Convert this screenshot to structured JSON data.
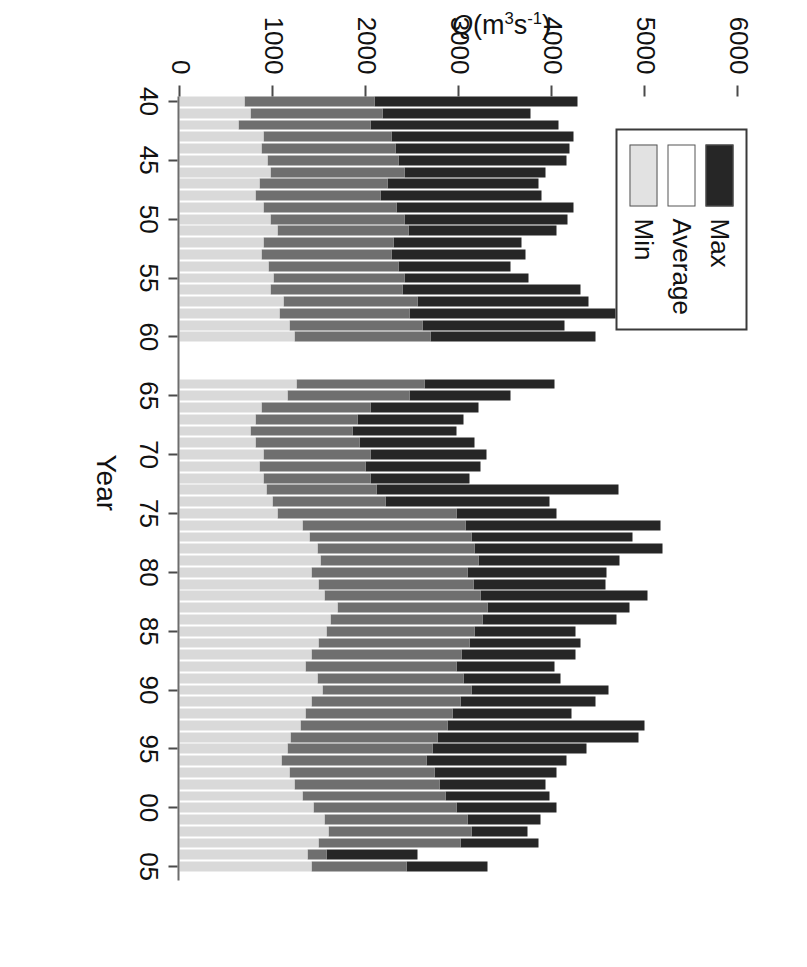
{
  "chart_data": {
    "type": "bar",
    "subtype": "stacked-horizontal-rotated",
    "title": "",
    "xlabel": "Year",
    "ylabel": "Q(m3s-1)",
    "ylabel_rich": "Q(m³s⁻¹)",
    "ylim": [
      0,
      6500
    ],
    "yticks": [
      0,
      1000,
      2000,
      3000,
      4000,
      5000,
      6000
    ],
    "ytick_labels": [
      "0",
      "1000",
      "2000",
      "3000",
      "4000",
      "5000",
      "6000"
    ],
    "xticks": [
      40,
      45,
      50,
      55,
      60,
      65,
      70,
      75,
      80,
      85,
      90,
      95,
      100,
      105
    ],
    "xtick_labels": [
      "40",
      "45",
      "50",
      "55",
      "60",
      "65",
      "70",
      "75",
      "80",
      "85",
      "90",
      "95",
      "00",
      "05"
    ],
    "grid": false,
    "legend_position": "upper-left",
    "orientation": "rotated-90-cw",
    "colors": {
      "max": "#262626",
      "average": "#6f6f6f",
      "min": "#d9d9d9",
      "axis": "#4a4a4a",
      "background": "#ffffff"
    },
    "series": [
      {
        "name": "Min",
        "key": "min"
      },
      {
        "name": "Average",
        "key": "average"
      },
      {
        "name": "Max",
        "key": "max"
      }
    ],
    "note": "Each year is one stacked bar: Min segment from 0, then Average, then Max (cumulative stacked, total = Max).",
    "categories": [
      1940,
      1941,
      1942,
      1943,
      1944,
      1945,
      1946,
      1947,
      1948,
      1949,
      1950,
      1951,
      1952,
      1953,
      1954,
      1955,
      1956,
      1957,
      1958,
      1959,
      1960,
      1964,
      1965,
      1966,
      1967,
      1968,
      1969,
      1970,
      1971,
      1972,
      1973,
      1974,
      1975,
      1976,
      1977,
      1978,
      1979,
      1980,
      1981,
      1982,
      1983,
      1984,
      1985,
      1986,
      1987,
      1988,
      1989,
      1990,
      1991,
      1992,
      1993,
      1994,
      1995,
      1996,
      1997,
      1998,
      1999,
      2000,
      2001,
      2002,
      2003,
      2004,
      2005
    ],
    "values_min": [
      700,
      760,
      640,
      900,
      880,
      950,
      980,
      860,
      820,
      900,
      980,
      1050,
      900,
      880,
      960,
      1010,
      980,
      1120,
      1080,
      1180,
      1240,
      1260,
      1160,
      880,
      820,
      760,
      820,
      900,
      860,
      900,
      940,
      1000,
      1060,
      1320,
      1400,
      1480,
      1520,
      1420,
      1500,
      1560,
      1700,
      1620,
      1580,
      1500,
      1420,
      1360,
      1480,
      1540,
      1420,
      1360,
      1300,
      1200,
      1160,
      1100,
      1180,
      1240,
      1320,
      1440,
      1560,
      1600,
      1500,
      1380,
      1420
    ],
    "values_average": [
      2100,
      2180,
      2060,
      2280,
      2320,
      2360,
      2420,
      2240,
      2160,
      2340,
      2420,
      2460,
      2300,
      2280,
      2360,
      2420,
      2400,
      2560,
      2480,
      2620,
      2700,
      2640,
      2480,
      2060,
      1920,
      1860,
      1940,
      2060,
      2000,
      2060,
      2120,
      2220,
      2980,
      3080,
      3140,
      3180,
      3220,
      3100,
      3160,
      3240,
      3320,
      3260,
      3180,
      3120,
      3040,
      2980,
      3060,
      3140,
      3020,
      2940,
      2880,
      2780,
      2720,
      2660,
      2740,
      2800,
      2860,
      2980,
      3100,
      3140,
      3020,
      1580,
      2440
    ],
    "values_max": [
      4280,
      3780,
      4080,
      4240,
      4200,
      4160,
      3940,
      3860,
      3900,
      4240,
      4180,
      4060,
      3680,
      3720,
      3560,
      3760,
      4320,
      4400,
      5340,
      4140,
      4480,
      4040,
      3560,
      3220,
      3060,
      2980,
      3180,
      3300,
      3240,
      3120,
      4720,
      3980,
      4060,
      5180,
      4880,
      5200,
      4740,
      4600,
      4580,
      5040,
      4840,
      4700,
      4260,
      4320,
      4260,
      4040,
      4100,
      4620,
      4480,
      4220,
      5000,
      4940,
      4380,
      4160,
      4060,
      3940,
      3980,
      4060,
      3880,
      3740,
      3860,
      2560,
      3320
    ]
  },
  "legend": {
    "items": [
      {
        "label": "Max",
        "key": "max"
      },
      {
        "label": "Average",
        "key": "average"
      },
      {
        "label": "Min",
        "key": "min"
      }
    ]
  },
  "axes": {
    "value_axis_title": "Q(m³s⁻¹)",
    "category_axis_title": "Year"
  }
}
